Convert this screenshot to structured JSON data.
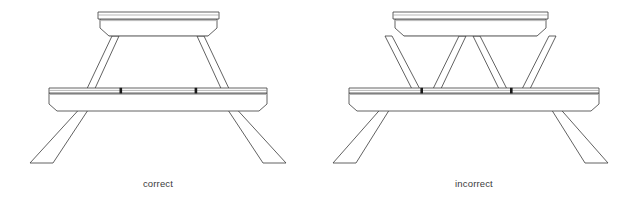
{
  "sheet": {
    "background_color": "#ffffff",
    "width": 632,
    "height": 203
  },
  "style": {
    "line_color": "#3a3a3a",
    "light_line_color": "#9a9a9a",
    "notch_color": "#1a1a1a",
    "fill_color": "#ffffff",
    "stroke_width": 0.8
  },
  "figures": [
    {
      "id": "correct",
      "caption": "correct",
      "subject": "picnic-table",
      "description": "Picnic table front elevation with legs splaying outward below the bench plank",
      "parts": {
        "tabletop_label": "tabletop",
        "bench_label": "bench plank",
        "leg_label": "leg",
        "notch_label": "bench notch"
      },
      "leg_geometry": "splayed-outward"
    },
    {
      "id": "incorrect",
      "caption": "incorrect",
      "subject": "picnic-table",
      "description": "Picnic table front elevation with legs converging inward under the tabletop",
      "parts": {
        "tabletop_label": "tabletop",
        "bench_label": "bench plank",
        "leg_label": "leg",
        "notch_label": "bench notch"
      },
      "leg_geometry": "converging-inward"
    }
  ]
}
